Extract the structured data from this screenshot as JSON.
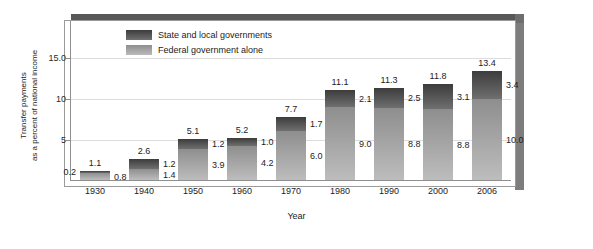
{
  "chart_data": {
    "type": "bar",
    "title": "",
    "subtitle": "",
    "xlabel": "Year",
    "ylabel": "Transfer payments as a percent of national income",
    "ylabel_line1": "Transfer payments",
    "ylabel_line2": "as a percent of national income",
    "categories": [
      "1930",
      "1940",
      "1950",
      "1960",
      "1970",
      "1980",
      "1990",
      "2000",
      "2006"
    ],
    "ylim": [
      0,
      18
    ],
    "yticks": [
      "5",
      "10",
      "15.0"
    ],
    "ytick_values": [
      5,
      10,
      15
    ],
    "grid": true,
    "stacked": true,
    "legend_position": "inside-top-left",
    "series": [
      {
        "name": "Federal government alone",
        "color": "#a8a8a8",
        "values": [
          0.8,
          1.4,
          3.9,
          4.2,
          6.0,
          9.0,
          8.8,
          8.8,
          10.0
        ]
      },
      {
        "name": "State and local governments",
        "color": "#4f4f4f",
        "values": [
          0.2,
          1.2,
          1.2,
          1.0,
          1.7,
          2.1,
          2.5,
          3.1,
          3.4
        ]
      }
    ],
    "totals": [
      1.1,
      2.6,
      5.1,
      5.2,
      7.7,
      11.1,
      11.3,
      11.8,
      13.4
    ],
    "bars": [
      {
        "year": "1930",
        "total": "1.1",
        "state": "0.2",
        "federal": "0.8",
        "state_side": "left",
        "federal_side": "right"
      },
      {
        "year": "1940",
        "total": "2.6",
        "state": "1.2",
        "federal": "1.4",
        "state_side": "right",
        "federal_side": "right"
      },
      {
        "year": "1950",
        "total": "5.1",
        "state": "1.2",
        "federal": "3.9",
        "state_side": "right",
        "federal_side": "right"
      },
      {
        "year": "1960",
        "total": "5.2",
        "state": "1.0",
        "federal": "4.2",
        "state_side": "right",
        "federal_side": "right"
      },
      {
        "year": "1970",
        "total": "7.7",
        "state": "1.7",
        "federal": "6.0",
        "state_side": "right",
        "federal_side": "right"
      },
      {
        "year": "1980",
        "total": "11.1",
        "state": "2.1",
        "federal": "9.0",
        "state_side": "right",
        "federal_side": "right"
      },
      {
        "year": "1990",
        "total": "11.3",
        "state": "2.5",
        "federal": "8.8",
        "state_side": "right",
        "federal_side": "right"
      },
      {
        "year": "2000",
        "total": "11.8",
        "state": "3.1",
        "federal": "8.8",
        "state_side": "right",
        "federal_side": "right"
      },
      {
        "year": "2006",
        "total": "13.4",
        "state": "3.4",
        "federal": "10.0",
        "state_side": "right",
        "federal_side": "right"
      }
    ]
  },
  "legend": {
    "items": [
      {
        "label": "State and local governments",
        "swatch": "state"
      },
      {
        "label": "Federal government alone",
        "swatch": "federal"
      }
    ]
  },
  "axes": {
    "y_tick_1": "15.0",
    "y_tick_2": "10",
    "y_tick_3": "5",
    "y_title_line1": "Transfer payments",
    "y_title_line2": "as a percent of national income",
    "x_title": "Year"
  },
  "colors": {
    "state_dark": "#3c3c3c",
    "state_light": "#6f6f6f",
    "federal_dark": "#8e8e8e",
    "federal_light": "#bdbdbd",
    "gridline": "#dcdcdc",
    "axis": "#8f8f8f",
    "frame_shadow": "#585858"
  }
}
